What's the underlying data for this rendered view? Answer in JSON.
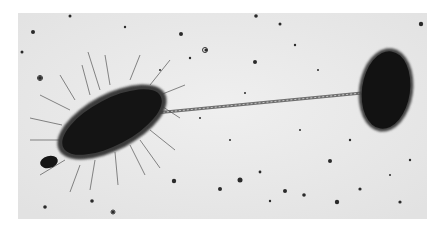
{
  "image": {
    "subject": "electron micrograph of bacterial conjugation",
    "style": "grayscale",
    "frame": {
      "x": 18,
      "y": 13,
      "width": 409,
      "height": 206
    },
    "colors": {
      "background": "#ececec",
      "cell": "#141414",
      "pilus": "#7a7a7a",
      "page": "#ffffff"
    },
    "elements": [
      {
        "name": "donor-cell",
        "description": "rod-shaped bacterium covered in fimbriae",
        "center": [
          112,
          122
        ],
        "length": 112,
        "width": 48,
        "angle": -28
      },
      {
        "name": "small-bud",
        "description": "small dark body at lower-left end of donor cell",
        "center": [
          49,
          162
        ],
        "rx": 9,
        "ry": 6
      },
      {
        "name": "recipient-cell",
        "description": "oval bacterium without fimbriae",
        "center": [
          386,
          90
        ],
        "rx": 25,
        "ry": 40
      },
      {
        "name": "sex-pilus",
        "description": "long thin filament connecting the two cells",
        "from": [
          155,
          113
        ],
        "to": [
          362,
          93
        ]
      }
    ]
  }
}
